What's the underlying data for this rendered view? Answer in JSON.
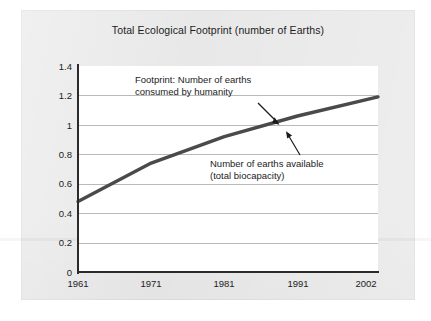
{
  "chart_data": {
    "type": "line",
    "title": "Total Ecological Footprint (number of Earths)",
    "xlabel": "",
    "ylabel": "",
    "x": [
      1961,
      1971,
      1981,
      1991,
      2002
    ],
    "x_tick_labels": [
      "1961",
      "1971",
      "1981",
      "1991",
      "2002"
    ],
    "xlim": [
      1961,
      2002
    ],
    "ylim": [
      0,
      1.4
    ],
    "y_tick_labels": [
      "0",
      "0.2",
      "0.4",
      "0.6",
      "0.8",
      "1",
      "1.2",
      "1.4"
    ],
    "y_ticks": [
      0,
      0.2,
      0.4,
      0.6,
      0.8,
      1.0,
      1.2,
      1.4
    ],
    "grid": "horizontal",
    "legend": "none",
    "series": [
      {
        "name": "Footprint: Number of earths consumed by humanity",
        "color": "#4a4a4a",
        "values": [
          0.48,
          0.74,
          0.92,
          1.06,
          1.19
        ]
      }
    ],
    "annotations": [
      {
        "name": "footprint-label",
        "line1": "Footprint: Number of earths",
        "line2": "consumed by humanity",
        "points_to": "line"
      },
      {
        "name": "biocapacity-label",
        "line1": "Number of earths available",
        "line2": "(total biocapacity)",
        "points_to": "line"
      }
    ]
  },
  "colors": {
    "panel_background": "#e8e8e8",
    "plot_background": "#ffffff",
    "axis": "#2b2b2b",
    "gridline": "#b9b9b9",
    "series_line": "#4a4a4a",
    "text": "#1c1c1c"
  }
}
